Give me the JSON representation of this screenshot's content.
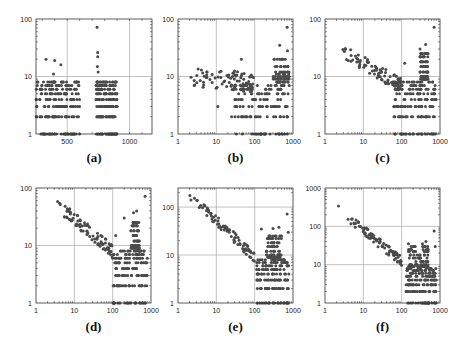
{
  "figure": {
    "point_color": "#4a4a4a",
    "grid_color": "#9a9a9a"
  },
  "chart_data": [
    {
      "id": "a",
      "type": "scatter",
      "caption": "(a)",
      "xscale": "linear",
      "yscale": "log",
      "xlim": [
        250,
        1180
      ],
      "ylim": [
        1,
        100
      ],
      "xticks": [
        500,
        1000
      ],
      "xtick_labels": [
        "500",
        "1000"
      ],
      "yticks": [
        1,
        10,
        100
      ],
      "ytick_labels": [
        "1",
        "10",
        "100"
      ],
      "grid": true,
      "clusters": [
        {
          "x": [
            250,
            600
          ],
          "levels": [
            1,
            2,
            3,
            4,
            5,
            6,
            7,
            8
          ],
          "density": 0.8
        },
        {
          "x": [
            730,
            900
          ],
          "levels": [
            1,
            2,
            3,
            4,
            5,
            6,
            7,
            8
          ],
          "density": 0.7
        }
      ],
      "outliers": [
        [
          330,
          20
        ],
        [
          400,
          19
        ],
        [
          450,
          16
        ],
        [
          390,
          11
        ],
        [
          740,
          72
        ],
        [
          745,
          26
        ],
        [
          745,
          22
        ],
        [
          742,
          15
        ],
        [
          748,
          12
        ],
        [
          900,
          3
        ]
      ]
    },
    {
      "id": "b",
      "type": "scatter",
      "caption": "(b)",
      "xscale": "log",
      "yscale": "log",
      "xlim": [
        1,
        1000
      ],
      "ylim": [
        1,
        100
      ],
      "xticks": [
        1,
        10,
        100,
        1000
      ],
      "xtick_labels": [
        "1",
        "10",
        "100",
        "1000"
      ],
      "yticks": [
        1,
        10,
        100
      ],
      "ytick_labels": [
        "1",
        "10",
        "100"
      ],
      "grid": true,
      "trend": {
        "x0": 2,
        "y0": 10,
        "x1": 100,
        "y1": 8,
        "spread": 0.35
      },
      "clusters": [
        {
          "x": [
            30,
            800
          ],
          "levels": [
            1,
            2,
            3,
            4,
            5,
            6,
            7
          ],
          "density": 0.6
        },
        {
          "x": [
            300,
            800
          ],
          "levels": [
            8,
            9,
            10,
            11,
            12,
            15,
            20
          ],
          "density": 0.5
        }
      ],
      "outliers": [
        [
          45,
          20
        ],
        [
          700,
          72
        ],
        [
          450,
          35
        ],
        [
          720,
          28
        ],
        [
          25,
          2
        ],
        [
          11,
          3
        ]
      ]
    },
    {
      "id": "c",
      "type": "scatter",
      "caption": "(c)",
      "xscale": "log",
      "yscale": "log",
      "xlim": [
        1,
        1000
      ],
      "ylim": [
        1,
        100
      ],
      "xticks": [
        1,
        10,
        100,
        1000
      ],
      "xtick_labels": [
        "1",
        "10",
        "100",
        "1000"
      ],
      "yticks": [
        1,
        10,
        100
      ],
      "ytick_labels": [
        "1",
        "10",
        "100"
      ],
      "grid": true,
      "trend": {
        "x0": 2,
        "y0": 32,
        "x1": 100,
        "y1": 7,
        "spread": 0.25
      },
      "clusters": [
        {
          "x": [
            60,
            800
          ],
          "levels": [
            1,
            2,
            3,
            4,
            5,
            6,
            7,
            8
          ],
          "density": 0.6
        },
        {
          "x": [
            300,
            500
          ],
          "levels": [
            9,
            10,
            12,
            15,
            18,
            22,
            25
          ],
          "density": 0.6
        }
      ],
      "outliers": [
        [
          700,
          72
        ],
        [
          420,
          36
        ],
        [
          300,
          30
        ],
        [
          120,
          17
        ]
      ]
    },
    {
      "id": "d",
      "type": "scatter",
      "caption": "(d)",
      "xscale": "log",
      "yscale": "log",
      "xlim": [
        1,
        1000
      ],
      "ylim": [
        1,
        100
      ],
      "xticks": [
        1,
        10,
        100,
        1000
      ],
      "xtick_labels": [
        "1",
        "10",
        "100",
        "1000"
      ],
      "yticks": [
        1,
        10,
        100
      ],
      "ytick_labels": [
        "1",
        "10",
        "100"
      ],
      "grid": true,
      "trend": {
        "x0": 2,
        "y0": 72,
        "x1": 100,
        "y1": 8,
        "spread": 0.22
      },
      "clusters": [
        {
          "x": [
            100,
            800
          ],
          "levels": [
            1,
            2,
            3,
            4,
            5,
            6,
            7,
            8
          ],
          "density": 0.6
        },
        {
          "x": [
            300,
            500
          ],
          "levels": [
            9,
            10,
            12,
            15,
            18,
            22,
            25
          ],
          "density": 0.6
        }
      ],
      "outliers": [
        [
          700,
          72
        ],
        [
          420,
          40
        ],
        [
          350,
          37
        ],
        [
          200,
          30
        ],
        [
          120,
          15
        ]
      ]
    },
    {
      "id": "e",
      "type": "scatter",
      "caption": "(e)",
      "xscale": "log",
      "yscale": "log",
      "xlim": [
        1,
        1000
      ],
      "ylim": [
        1,
        250
      ],
      "xticks": [
        1,
        10,
        100,
        1000
      ],
      "xtick_labels": [
        "1",
        "10",
        "100",
        "1000"
      ],
      "yticks": [
        1,
        10,
        100
      ],
      "ytick_labels": [
        "1",
        "10",
        "100"
      ],
      "grid": true,
      "trend": {
        "x0": 2,
        "y0": 180,
        "x1": 100,
        "y1": 9,
        "spread": 0.22
      },
      "clusters": [
        {
          "x": [
            110,
            800
          ],
          "levels": [
            1,
            2,
            3,
            4,
            5,
            6,
            7,
            8
          ],
          "density": 0.6
        },
        {
          "x": [
            200,
            500
          ],
          "levels": [
            9,
            10,
            12,
            15,
            18,
            22,
            25
          ],
          "density": 0.6
        }
      ],
      "outliers": [
        [
          700,
          72
        ],
        [
          430,
          38
        ],
        [
          300,
          36
        ],
        [
          150,
          35
        ],
        [
          750,
          30
        ]
      ]
    },
    {
      "id": "f",
      "type": "scatter",
      "caption": "(f)",
      "xscale": "log",
      "yscale": "log",
      "xlim": [
        1,
        1000
      ],
      "ylim": [
        1,
        1000
      ],
      "xticks": [
        1,
        10,
        100,
        1000
      ],
      "xtick_labels": [
        "1",
        "10",
        "100",
        "1000"
      ],
      "yticks": [
        1,
        10,
        100,
        1000
      ],
      "ytick_labels": [
        "1",
        "10",
        "100",
        "1000"
      ],
      "grid": true,
      "trend": {
        "x0": 2,
        "y0": 300,
        "x1": 100,
        "y1": 12,
        "spread": 0.25
      },
      "clusters": [
        {
          "x": [
            130,
            800
          ],
          "levels": [
            1,
            2,
            3,
            4,
            5,
            6,
            7,
            8
          ],
          "density": 0.6
        },
        {
          "x": [
            150,
            500
          ],
          "levels": [
            9,
            10,
            12,
            15,
            18,
            22,
            25,
            30
          ],
          "density": 0.6
        }
      ],
      "outliers": [
        [
          700,
          75
        ],
        [
          430,
          40
        ],
        [
          350,
          35
        ],
        [
          150,
          35
        ],
        [
          750,
          30
        ]
      ]
    }
  ]
}
